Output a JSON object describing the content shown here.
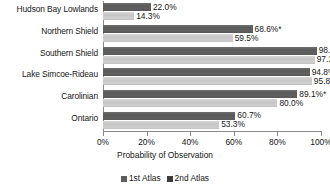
{
  "chart_data": {
    "type": "bar",
    "orientation": "horizontal",
    "title": "",
    "xlabel": "Probability of Observation",
    "ylabel": "",
    "xlim": [
      0,
      100
    ],
    "xtick_labels": [
      "0%",
      "20%",
      "40%",
      "60%",
      "80%",
      "100%"
    ],
    "xticks": [
      0,
      20,
      40,
      60,
      80,
      100
    ],
    "grid": false,
    "legend_position": "bottom-center",
    "categories": [
      "Hudson Bay Lowlands",
      "Northern Shield",
      "Southern Shield",
      "Lake Simcoe-Rideau",
      "Carolinian",
      "Ontario"
    ],
    "series": [
      {
        "name": "1st Atlas",
        "color": "#5d5d5d",
        "values": [
          22.0,
          68.6,
          98.0,
          94.8,
          89.1,
          60.7
        ],
        "labels": [
          "22.0%",
          "68.6%*",
          "98.0%",
          "94.8%",
          "89.1%*",
          "60.7%"
        ]
      },
      {
        "name": "2nd Atlas",
        "color": "#c9c9c9",
        "values": [
          14.3,
          59.5,
          97.1,
          95.8,
          80.0,
          53.3
        ],
        "labels": [
          "14.3%",
          "59.5%",
          "97.1%",
          "95.8%",
          "80.0%",
          "53.3%"
        ]
      }
    ],
    "annotations": [
      "* denotes significant difference"
    ]
  },
  "legend": {
    "items": [
      {
        "label": "1st Atlas",
        "swatch": "legend-swatch-1st-atlas"
      },
      {
        "label": "2nd Atlas",
        "swatch": "legend-swatch-2nd-atlas"
      }
    ]
  }
}
